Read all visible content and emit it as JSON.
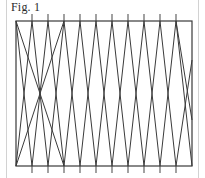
{
  "figure": {
    "label": "Fig. 1",
    "caption_position": "top-left"
  },
  "colors": {
    "background": "#ffffff",
    "frame_stroke": "#3a3a3a",
    "line_stroke": "#3a3a3a",
    "tick_stroke": "#555555",
    "outer_border": "#d2d2d2",
    "label_text": "#2b2b2b"
  },
  "canvas": {
    "width": 205,
    "height": 178
  },
  "chart_data": {
    "type": "line",
    "title": "Fig. 1",
    "subtitle": "",
    "xlabel": "",
    "ylabel": "",
    "grid": false,
    "legend": null,
    "frame": {
      "x0": 16,
      "y0": 21,
      "x1": 192,
      "y1": 166,
      "stroke_width": 1.2
    },
    "ticks": {
      "count": 10,
      "spacing": 16.0,
      "first_x": 32,
      "overhang_top": 7,
      "overhang_bottom": 7,
      "stroke_width": 1.1,
      "x_positions": [
        32,
        48,
        64,
        80,
        96,
        112,
        128,
        144,
        160,
        176
      ]
    },
    "zigzag": {
      "vertex_spacing": 16.0,
      "top_vertices_x": [
        32,
        64,
        96,
        128,
        160
      ],
      "bottom_vertices_x": [
        16,
        48,
        80,
        112,
        144,
        176
      ],
      "segments": [
        {
          "x1": 16,
          "y1": 166,
          "x2": 32,
          "y2": 21
        },
        {
          "x1": 32,
          "y1": 21,
          "x2": 48,
          "y2": 166
        },
        {
          "x1": 48,
          "y1": 166,
          "x2": 64,
          "y2": 21
        },
        {
          "x1": 64,
          "y1": 21,
          "x2": 80,
          "y2": 166
        },
        {
          "x1": 80,
          "y1": 166,
          "x2": 96,
          "y2": 21
        },
        {
          "x1": 96,
          "y1": 21,
          "x2": 112,
          "y2": 166
        },
        {
          "x1": 112,
          "y1": 166,
          "x2": 128,
          "y2": 21
        },
        {
          "x1": 128,
          "y1": 21,
          "x2": 144,
          "y2": 166
        },
        {
          "x1": 144,
          "y1": 166,
          "x2": 160,
          "y2": 21
        },
        {
          "x1": 160,
          "y1": 21,
          "x2": 176,
          "y2": 166
        }
      ],
      "second_family": [
        {
          "x1": 16,
          "y1": 21,
          "x2": 32,
          "y2": 166
        },
        {
          "x1": 32,
          "y1": 166,
          "x2": 48,
          "y2": 21
        },
        {
          "x1": 48,
          "y1": 21,
          "x2": 64,
          "y2": 166
        },
        {
          "x1": 64,
          "y1": 166,
          "x2": 80,
          "y2": 21
        },
        {
          "x1": 80,
          "y1": 21,
          "x2": 96,
          "y2": 166
        },
        {
          "x1": 96,
          "y1": 166,
          "x2": 112,
          "y2": 21
        },
        {
          "x1": 112,
          "y1": 21,
          "x2": 128,
          "y2": 166
        },
        {
          "x1": 128,
          "y1": 166,
          "x2": 144,
          "y2": 21
        },
        {
          "x1": 144,
          "y1": 21,
          "x2": 160,
          "y2": 166
        },
        {
          "x1": 160,
          "y1": 166,
          "x2": 176,
          "y2": 21
        },
        {
          "x1": 176,
          "y1": 21,
          "x2": 192,
          "y2": 166
        }
      ],
      "long_diagonals": [
        {
          "x1": 16,
          "y1": 21,
          "x2": 64,
          "y2": 166
        },
        {
          "x1": 16,
          "y1": 166,
          "x2": 64,
          "y2": 21
        },
        {
          "x1": 176,
          "y1": 21,
          "x2": 192,
          "y2": 120
        },
        {
          "x1": 176,
          "y1": 166,
          "x2": 192,
          "y2": 60
        }
      ]
    }
  }
}
